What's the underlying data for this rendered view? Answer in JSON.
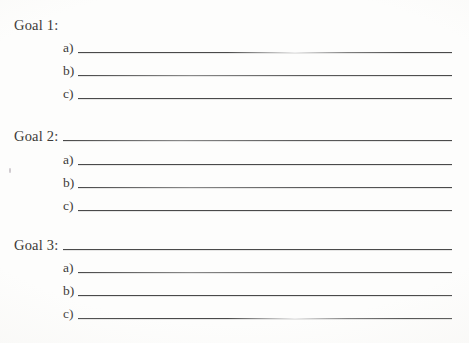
{
  "document": {
    "kind": "goals-worksheet",
    "background_color": "#fdfdfc",
    "ink_color": "#3c3a38",
    "rule_color": "#4a4a4a"
  },
  "goals": [
    {
      "label": "Goal 1:",
      "has_title_rule": false,
      "items": [
        {
          "label": "a)"
        },
        {
          "label": "b)"
        },
        {
          "label": "c)"
        }
      ]
    },
    {
      "label": "Goal 2:",
      "has_title_rule": true,
      "items": [
        {
          "label": "a)"
        },
        {
          "label": "b)"
        },
        {
          "label": "c)"
        }
      ]
    },
    {
      "label": "Goal 3:",
      "has_title_rule": true,
      "items": [
        {
          "label": "a)"
        },
        {
          "label": "b)"
        },
        {
          "label": "c)"
        }
      ]
    }
  ]
}
